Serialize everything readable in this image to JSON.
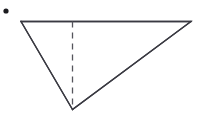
{
  "canvas": {
    "width": 197,
    "height": 125,
    "background_color": "#ffffff",
    "title": "Inverted triangle with dashed altitude"
  },
  "style": {
    "stroke_color": "#3a3a42",
    "solid_stroke_width": 1.3,
    "dashed_stroke_color": "#55555c",
    "dashed_stroke_width": 1.3,
    "dash_pattern": "6,5",
    "fill": "none",
    "bullet_color": "#1b1b1f"
  },
  "figure": {
    "type": "triangle",
    "fill": "none",
    "vertices": [
      {
        "name": "top-left",
        "x": 21,
        "y": 21.5
      },
      {
        "name": "top-right",
        "x": 191,
        "y": 21.5
      },
      {
        "name": "bottom-apex",
        "x": 72.5,
        "y": 109.5
      }
    ],
    "polygon_points": "21,21.5 191,21.5 72.5,109.5",
    "edges": [
      {
        "name": "top-edge",
        "from": "top-left",
        "to": "top-right",
        "style": "solid"
      },
      {
        "name": "right-edge",
        "from": "top-right",
        "to": "bottom-apex",
        "style": "solid"
      },
      {
        "name": "left-edge",
        "from": "bottom-apex",
        "to": "top-left",
        "style": "solid"
      }
    ],
    "altitude": {
      "name": "dashed-altitude",
      "style": "dashed",
      "from": {
        "x": 72.5,
        "y": 21.5
      },
      "to": {
        "x": 72.5,
        "y": 109.5
      },
      "foot_label": "",
      "apex_label": ""
    }
  },
  "bullet": {
    "name": "list-bullet",
    "shape": "filled-circle",
    "cx": 6,
    "cy": 11,
    "r": 2.6,
    "label": ""
  },
  "labels": []
}
